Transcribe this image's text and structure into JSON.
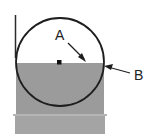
{
  "diagram": {
    "labels": {
      "a": "A",
      "b": "B"
    },
    "colors": {
      "fill": "#9a9a9a",
      "fill_lower": "#a3a3a3",
      "stroke": "#1e1e1e",
      "background": "#ffffff"
    }
  }
}
